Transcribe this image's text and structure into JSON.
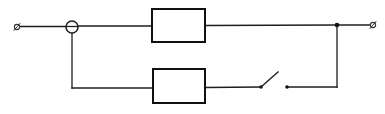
{
  "diagram": {
    "type": "circuit-schematic",
    "colors": {
      "line": "#1e1e1e",
      "background": "#ffffff"
    },
    "elements": {
      "terminal_left": {
        "x": 17,
        "y": 27,
        "label": ""
      },
      "terminal_right": {
        "x": 373,
        "y": 25,
        "label": ""
      },
      "left_junction_circle": {
        "cx": 72,
        "cy": 27,
        "r": 6,
        "symbol": "circle-with-bar"
      },
      "right_junction_node": {
        "cx": 337,
        "cy": 25,
        "r": 2.3
      },
      "upper_component": {
        "x": 152,
        "y": 9,
        "width": 53,
        "height": 33,
        "label": ""
      },
      "lower_component": {
        "x": 153,
        "y": 69,
        "width": 52,
        "height": 34,
        "label": ""
      },
      "switch": {
        "state": "open",
        "pivot": {
          "x": 261,
          "y": 87
        },
        "blade_end": {
          "x": 278,
          "y": 72
        },
        "contact": {
          "x": 287,
          "y": 87
        }
      }
    },
    "branches": [
      {
        "name": "upper",
        "components": [
          "upper_component"
        ]
      },
      {
        "name": "lower",
        "components": [
          "lower_component",
          "switch"
        ]
      }
    ]
  }
}
